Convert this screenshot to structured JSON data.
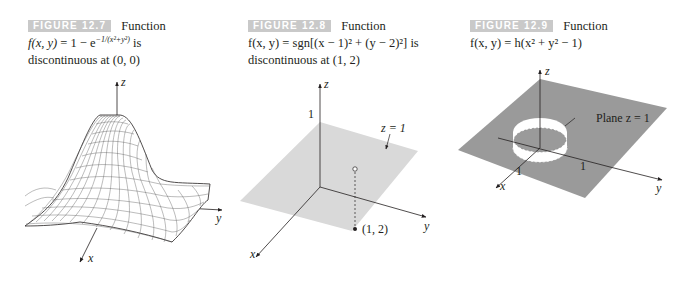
{
  "figures": [
    {
      "label": "FIGURE 12.7",
      "caption_word": "Function",
      "formula_lhs": "f(x, y)",
      "formula_rhs": " = 1 − e",
      "formula_exp": "−1/(x²+y²)",
      "formula_tail": " is",
      "caption_line3": "discontinuous at  (0, 0)",
      "axes": {
        "z": "z",
        "y": "y",
        "x": "x"
      },
      "surface": "bell-shaped wireframe mesh"
    },
    {
      "label": "FIGURE 12.8",
      "caption_word": "Function",
      "formula": "f(x, y) = sgn[(x − 1)² + (y − 2)²]  is",
      "caption_line3": "discontinuous at  (1, 2)",
      "axes": {
        "z": "z",
        "y": "y",
        "x": "x"
      },
      "tick_z": "1",
      "plane_label": "z = 1",
      "point_label": "(1, 2)"
    },
    {
      "label": "FIGURE 12.9",
      "caption_word": "Function",
      "formula": "f(x, y) = h(x² + y² − 1)",
      "axes": {
        "z": "z",
        "y": "y",
        "x": "x"
      },
      "plane_label": "Plane z = 1",
      "tick_x": "1",
      "tick_y": "1"
    }
  ],
  "colors": {
    "label_bg": "#c9c9c9",
    "plane_light": "#d9d9d9",
    "plane_dark": "#9a9a9a",
    "ink": "#231f20"
  }
}
